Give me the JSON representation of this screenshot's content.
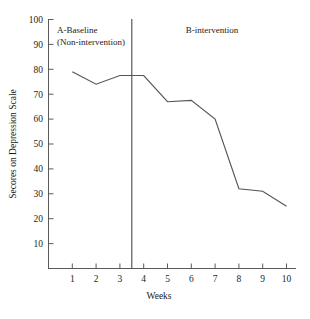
{
  "chart_data": {
    "type": "line",
    "title": "",
    "xlabel": "Weeks",
    "ylabel": "Secores on Depression Scale",
    "x": [
      1,
      2,
      3,
      4,
      5,
      6,
      7,
      8,
      9,
      10
    ],
    "values": [
      79,
      74,
      77.5,
      77.5,
      67,
      67.5,
      60,
      32,
      31,
      25
    ],
    "series": [
      {
        "name": "Depression score",
        "values": [
          79,
          74,
          77.5,
          77.5,
          67,
          67.5,
          60,
          32,
          31,
          25
        ]
      }
    ],
    "categories": [
      "1",
      "2",
      "3",
      "4",
      "5",
      "6",
      "7",
      "8",
      "9",
      "10"
    ],
    "xtick_labels": [
      "1",
      "2",
      "3",
      "4",
      "5",
      "6",
      "7",
      "8",
      "9",
      "10"
    ],
    "ytick_labels": [
      "10",
      "20",
      "30",
      "40",
      "50",
      "60",
      "70",
      "80",
      "90",
      "100"
    ],
    "ytick_values": [
      10,
      20,
      30,
      40,
      50,
      60,
      70,
      80,
      90,
      100
    ],
    "xlim": [
      0.45,
      10.55
    ],
    "ylim": [
      0,
      100
    ],
    "grid": false,
    "legend": "none",
    "line_color": "#555555",
    "axis_color": "#5a5a5a",
    "annotations": [
      {
        "name": "phase-line",
        "type": "vline",
        "x": 3.5,
        "color": "#4a4a4a"
      },
      {
        "name": "phase-a-label",
        "type": "text",
        "lines": [
          "A-Baseline",
          "(Non-intervention)"
        ]
      },
      {
        "name": "phase-b-label",
        "type": "text",
        "lines": [
          "B-intervention"
        ]
      }
    ]
  },
  "axes": {
    "y_title": "Secores on Depression Scale",
    "x_title": "Weeks"
  },
  "phases": {
    "a_line1": "A-Baseline",
    "a_line2": "(Non-intervention)",
    "b_line1": "B-intervention"
  },
  "yticks": {
    "t100": "100",
    "t90": "90",
    "t80": "80",
    "t70": "70",
    "t60": "60",
    "t50": "50",
    "t40": "40",
    "t30": "30",
    "t20": "20",
    "t10": "10"
  },
  "xticks": {
    "w1": "1",
    "w2": "2",
    "w3": "3",
    "w4": "4",
    "w5": "5",
    "w6": "6",
    "w7": "7",
    "w8": "8",
    "w9": "9",
    "w10": "10"
  }
}
